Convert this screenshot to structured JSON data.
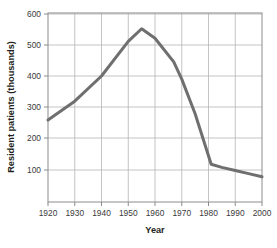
{
  "chart_data": {
    "type": "line",
    "title": "",
    "xlabel": "Year",
    "ylabel": "Resident patients (thousands)",
    "xlim": [
      1920,
      2000
    ],
    "ylim": [
      0,
      600
    ],
    "xticks": [
      1920,
      1930,
      1940,
      1950,
      1960,
      1970,
      1980,
      1990,
      2000
    ],
    "xtick_labels": [
      "1920",
      "1930",
      "1940",
      "1950",
      "1960",
      "1970",
      "1980",
      "1990",
      "2000"
    ],
    "yticks": [
      100,
      200,
      300,
      400,
      500,
      600
    ],
    "ytick_labels": [
      "100",
      "200",
      "300",
      "400",
      "500",
      "600"
    ],
    "grid": true,
    "legend": "none",
    "series": [
      {
        "name": "Resident patients",
        "color": "#6f6f6f",
        "line_width": 3,
        "x": [
          1920,
          1930,
          1940,
          1950,
          1955,
          1960,
          1967,
          1970,
          1975,
          1981,
          1985,
          1990,
          1995,
          2000
        ],
        "values": [
          260,
          320,
          400,
          510,
          550,
          520,
          445,
          390,
          280,
          120,
          110,
          100,
          90,
          80
        ]
      }
    ]
  }
}
